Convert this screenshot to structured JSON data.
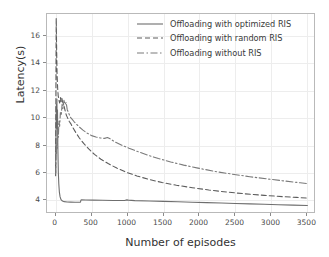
{
  "chart_data": {
    "type": "line",
    "title": "",
    "xlabel": "Number of episodes",
    "ylabel": "Latency(s)",
    "xlim": [
      -120,
      3620
    ],
    "ylim": [
      3.0,
      17.6
    ],
    "xticks": [
      0,
      500,
      1000,
      1500,
      2000,
      2500,
      3000,
      3500
    ],
    "yticks": [
      4,
      6,
      8,
      10,
      12,
      14,
      16
    ],
    "grid": true,
    "legend_position": "upper right",
    "series": [
      {
        "name": "Offloading with optimized RIS",
        "style": "solid",
        "color": "#6e6e6e",
        "points": [
          [
            0,
            6.0
          ],
          [
            6,
            9.4
          ],
          [
            10,
            11.0
          ],
          [
            14,
            9.6
          ],
          [
            18,
            11.4
          ],
          [
            22,
            9.2
          ],
          [
            26,
            10.6
          ],
          [
            30,
            8.2
          ],
          [
            34,
            7.0
          ],
          [
            38,
            6.0
          ],
          [
            44,
            5.2
          ],
          [
            52,
            4.6
          ],
          [
            62,
            4.25
          ],
          [
            75,
            4.05
          ],
          [
            95,
            3.95
          ],
          [
            120,
            3.9
          ],
          [
            160,
            3.88
          ],
          [
            210,
            3.87
          ],
          [
            270,
            3.86
          ],
          [
            320,
            3.86
          ],
          [
            345,
            3.86
          ],
          [
            352,
            4.02
          ],
          [
            360,
            4.03
          ],
          [
            420,
            4.02
          ],
          [
            520,
            4.01
          ],
          [
            650,
            4.0
          ],
          [
            800,
            3.99
          ],
          [
            960,
            3.99
          ],
          [
            990,
            4.03
          ],
          [
            1010,
            4.01
          ],
          [
            1100,
            3.98
          ],
          [
            1300,
            3.95
          ],
          [
            1500,
            3.92
          ],
          [
            1700,
            3.89
          ],
          [
            1900,
            3.86
          ],
          [
            2100,
            3.83
          ],
          [
            2300,
            3.8
          ],
          [
            2500,
            3.77
          ],
          [
            2700,
            3.74
          ],
          [
            2900,
            3.71
          ],
          [
            3100,
            3.68
          ],
          [
            3300,
            3.65
          ],
          [
            3500,
            3.62
          ]
        ]
      },
      {
        "name": "Offloading with random RIS",
        "style": "dashed",
        "color": "#5c5c5c",
        "points": [
          [
            0,
            5.8
          ],
          [
            4,
            12.0
          ],
          [
            8,
            17.3
          ],
          [
            14,
            15.0
          ],
          [
            20,
            13.2
          ],
          [
            28,
            12.2
          ],
          [
            36,
            11.6
          ],
          [
            46,
            11.3
          ],
          [
            56,
            11.1
          ],
          [
            66,
            11.5
          ],
          [
            76,
            11.2
          ],
          [
            86,
            11.45
          ],
          [
            96,
            11.2
          ],
          [
            108,
            11.05
          ],
          [
            120,
            10.8
          ],
          [
            134,
            10.5
          ],
          [
            150,
            10.2
          ],
          [
            168,
            10.0
          ],
          [
            190,
            9.75
          ],
          [
            210,
            9.6
          ],
          [
            240,
            9.3
          ],
          [
            280,
            8.95
          ],
          [
            330,
            8.55
          ],
          [
            390,
            8.15
          ],
          [
            460,
            7.75
          ],
          [
            540,
            7.35
          ],
          [
            630,
            7.0
          ],
          [
            730,
            6.68
          ],
          [
            850,
            6.35
          ],
          [
            980,
            6.05
          ],
          [
            1130,
            5.78
          ],
          [
            1300,
            5.52
          ],
          [
            1480,
            5.3
          ],
          [
            1680,
            5.1
          ],
          [
            1900,
            4.92
          ],
          [
            2130,
            4.75
          ],
          [
            2380,
            4.6
          ],
          [
            2640,
            4.47
          ],
          [
            2900,
            4.36
          ],
          [
            3150,
            4.27
          ],
          [
            3350,
            4.21
          ],
          [
            3500,
            4.16
          ]
        ]
      },
      {
        "name": "Offloading without RIS",
        "style": "dashdot",
        "color": "#7a7a7a",
        "points": [
          [
            0,
            5.95
          ],
          [
            6,
            8.0
          ],
          [
            12,
            7.4
          ],
          [
            18,
            8.6
          ],
          [
            24,
            7.8
          ],
          [
            30,
            9.2
          ],
          [
            38,
            8.6
          ],
          [
            46,
            9.8
          ],
          [
            56,
            9.4
          ],
          [
            66,
            10.4
          ],
          [
            78,
            10.2
          ],
          [
            90,
            11.0
          ],
          [
            102,
            10.7
          ],
          [
            116,
            11.3
          ],
          [
            130,
            11.0
          ],
          [
            146,
            11.15
          ],
          [
            162,
            10.6
          ],
          [
            180,
            10.4
          ],
          [
            200,
            10.1
          ],
          [
            225,
            9.95
          ],
          [
            255,
            9.75
          ],
          [
            290,
            9.55
          ],
          [
            330,
            9.35
          ],
          [
            380,
            9.12
          ],
          [
            440,
            8.9
          ],
          [
            500,
            8.72
          ],
          [
            560,
            8.62
          ],
          [
            620,
            8.55
          ],
          [
            680,
            8.52
          ],
          [
            720,
            8.58
          ],
          [
            760,
            8.48
          ],
          [
            830,
            8.25
          ],
          [
            920,
            8.02
          ],
          [
            1020,
            7.8
          ],
          [
            1140,
            7.56
          ],
          [
            1280,
            7.3
          ],
          [
            1430,
            7.05
          ],
          [
            1600,
            6.8
          ],
          [
            1780,
            6.57
          ],
          [
            1980,
            6.35
          ],
          [
            2200,
            6.12
          ],
          [
            2440,
            5.92
          ],
          [
            2700,
            5.72
          ],
          [
            2960,
            5.55
          ],
          [
            3200,
            5.4
          ],
          [
            3400,
            5.28
          ],
          [
            3500,
            5.22
          ]
        ]
      }
    ]
  }
}
